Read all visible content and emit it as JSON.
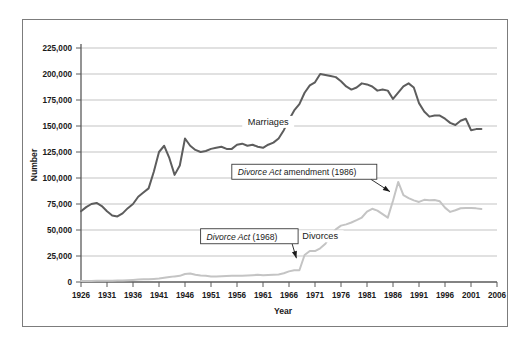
{
  "chart_data": {
    "type": "line",
    "title": "",
    "xlabel": "Year",
    "ylabel": "Number",
    "xlim": [
      1926,
      2006
    ],
    "ylim": [
      0,
      225000
    ],
    "grid": true,
    "legend_position": "inline-labels",
    "y_ticks": [
      0,
      25000,
      50000,
      75000,
      100000,
      125000,
      150000,
      175000,
      200000,
      225000
    ],
    "y_tick_labels": [
      "0",
      "25,000",
      "50,000",
      "75,000",
      "100,000",
      "125,000",
      "150,000",
      "175,000",
      "200,000",
      "225,000"
    ],
    "x_ticks": [
      1926,
      1931,
      1936,
      1941,
      1946,
      1951,
      1956,
      1961,
      1966,
      1971,
      1976,
      1981,
      1986,
      1991,
      1996,
      2001,
      2006
    ],
    "x_tick_labels": [
      "1926",
      "1931",
      "1936",
      "1941",
      "1946",
      "1951",
      "1956",
      "1961",
      "1966",
      "1971",
      "1976",
      "1981",
      "1986",
      "1991",
      "1996",
      "2001",
      "2006"
    ],
    "series": [
      {
        "name": "Marriages",
        "color": "#5d5d5d",
        "label_year": 1962,
        "label_value": 152000,
        "x": [
          1926,
          1927,
          1928,
          1929,
          1930,
          1931,
          1932,
          1933,
          1934,
          1935,
          1936,
          1937,
          1938,
          1939,
          1940,
          1941,
          1942,
          1943,
          1944,
          1945,
          1946,
          1947,
          1948,
          1949,
          1950,
          1951,
          1952,
          1953,
          1954,
          1955,
          1956,
          1957,
          1958,
          1959,
          1960,
          1961,
          1962,
          1963,
          1964,
          1965,
          1966,
          1967,
          1968,
          1969,
          1970,
          1971,
          1972,
          1973,
          1974,
          1975,
          1976,
          1977,
          1978,
          1979,
          1980,
          1981,
          1982,
          1983,
          1984,
          1985,
          1986,
          1987,
          1988,
          1989,
          1990,
          1991,
          1992,
          1993,
          1994,
          1995,
          1996,
          1997,
          1998,
          1999,
          2000,
          2001,
          2002,
          2003
        ],
        "y": [
          68000,
          72000,
          75000,
          76000,
          73000,
          68000,
          64000,
          63000,
          66000,
          71000,
          75000,
          82000,
          86000,
          90000,
          106000,
          125000,
          131000,
          119000,
          103000,
          112000,
          138000,
          131000,
          127000,
          125000,
          126000,
          128000,
          129000,
          130000,
          128000,
          128000,
          132000,
          133000,
          131000,
          132000,
          130000,
          129000,
          132000,
          134000,
          138000,
          146000,
          156000,
          165000,
          171000,
          182000,
          189000,
          192000,
          200000,
          199000,
          198000,
          197000,
          193000,
          188000,
          185000,
          187000,
          191000,
          190000,
          188000,
          184000,
          185000,
          184000,
          176000,
          182000,
          188000,
          191000,
          187000,
          172000,
          164000,
          159000,
          160000,
          160000,
          157000,
          153000,
          151000,
          155000,
          157000,
          146000,
          147000,
          147000
        ]
      },
      {
        "name": "Divorces",
        "color": "#c4c4c4",
        "label_year": 1972,
        "label_value": 42000,
        "x": [
          1926,
          1927,
          1928,
          1929,
          1930,
          1931,
          1932,
          1933,
          1934,
          1935,
          1936,
          1937,
          1938,
          1939,
          1940,
          1941,
          1942,
          1943,
          1944,
          1945,
          1946,
          1947,
          1948,
          1949,
          1950,
          1951,
          1952,
          1953,
          1954,
          1955,
          1956,
          1957,
          1958,
          1959,
          1960,
          1961,
          1962,
          1963,
          1964,
          1965,
          1966,
          1967,
          1968,
          1969,
          1970,
          1971,
          1972,
          1973,
          1974,
          1975,
          1976,
          1977,
          1978,
          1979,
          1980,
          1981,
          1982,
          1983,
          1984,
          1985,
          1986,
          1987,
          1988,
          1989,
          1990,
          1991,
          1992,
          1993,
          1994,
          1995,
          1996,
          1997,
          1998,
          1999,
          2000,
          2001,
          2002,
          2003
        ],
        "y": [
          1000,
          1000,
          1000,
          1100,
          1200,
          1200,
          1300,
          1400,
          1500,
          1700,
          2000,
          2300,
          2600,
          2700,
          3000,
          3400,
          4000,
          4700,
          5400,
          5900,
          7700,
          8200,
          6900,
          6200,
          5900,
          5300,
          5300,
          5500,
          5700,
          6000,
          6100,
          6000,
          6200,
          6500,
          6900,
          6600,
          6800,
          7000,
          7200,
          8400,
          10200,
          11200,
          11300,
          26000,
          29800,
          29700,
          32400,
          36700,
          45000,
          50600,
          54200,
          55400,
          57200,
          59500,
          62000,
          67700,
          70400,
          68600,
          65200,
          61900,
          78200,
          96200,
          83500,
          80700,
          78500,
          77000,
          79000,
          78700,
          78900,
          77600,
          71500,
          67400,
          69000,
          70900,
          71100,
          71100,
          70800,
          70200
        ]
      }
    ],
    "annotations": [
      {
        "id": "divorce-act-1968",
        "text_italic": "Divorce Act",
        "text_roman": " (1968)",
        "target_year": 1968,
        "target_value": 20000,
        "box_year": 1949,
        "box_value": 44000
      },
      {
        "id": "divorce-act-amendment-1986",
        "text_italic": "Divorce Act",
        "text_roman": " amendment (1986)",
        "target_year": 1986,
        "target_value": 84000,
        "box_year": 1955,
        "box_value": 106000
      }
    ]
  }
}
